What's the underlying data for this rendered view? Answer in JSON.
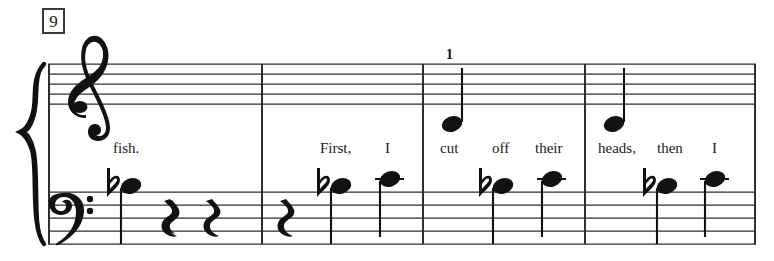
{
  "page": {
    "width": 774,
    "height": 261,
    "background": "#ffffff",
    "ink_color": "#111111"
  },
  "score": {
    "measure_number": "9",
    "system": {
      "left": 48,
      "right": 756,
      "brace": "curly-brace",
      "staves": [
        {
          "name": "treble",
          "clef": "treble-clef",
          "clef_glyph": "𝄞",
          "top_line_y": 64,
          "line_spacing": 10
        },
        {
          "name": "bass",
          "clef": "bass-clef",
          "clef_glyph": "𝄢",
          "top_line_y": 192,
          "line_spacing": 13
        }
      ],
      "barlines_x": [
        262,
        423,
        585,
        756
      ]
    },
    "measures": [
      {
        "index": 1,
        "number": "9",
        "x_start": 48,
        "x_end": 262,
        "treble_notes": [],
        "bass_notes": [
          {
            "x": 122,
            "y": 186,
            "accidental": "flat",
            "stem": "down",
            "head": "quarter-notehead",
            "ledger": false
          }
        ],
        "rests": [
          {
            "x": 173,
            "y": 218,
            "type": "quarter-rest"
          },
          {
            "x": 215,
            "y": 218,
            "type": "quarter-rest"
          }
        ]
      },
      {
        "index": 2,
        "number": "10",
        "x_start": 262,
        "x_end": 423,
        "treble_notes": [],
        "bass_notes": [
          {
            "x": 332,
            "y": 186,
            "accidental": "flat",
            "stem": "down",
            "head": "quarter-notehead",
            "ledger": false
          },
          {
            "x": 387,
            "y": 179,
            "accidental": "none",
            "stem": "down",
            "head": "quarter-notehead",
            "ledger": true
          }
        ],
        "rests": [
          {
            "x": 288,
            "y": 218,
            "type": "quarter-rest"
          }
        ]
      },
      {
        "index": 3,
        "number": "11",
        "x_start": 423,
        "x_end": 585,
        "fingering": {
          "text": "1",
          "x": 448,
          "y": 50
        },
        "treble_notes": [
          {
            "x": 452,
            "y": 124,
            "accidental": "none",
            "stem": "up",
            "head": "quarter-notehead",
            "ledger": false
          }
        ],
        "bass_notes": [
          {
            "x": 494,
            "y": 186,
            "accidental": "flat",
            "stem": "down",
            "head": "quarter-notehead",
            "ledger": false
          },
          {
            "x": 549,
            "y": 179,
            "accidental": "none",
            "stem": "down",
            "head": "quarter-notehead",
            "ledger": true
          }
        ],
        "rests": []
      },
      {
        "index": 4,
        "number": "12",
        "x_start": 585,
        "x_end": 756,
        "treble_notes": [
          {
            "x": 614,
            "y": 124,
            "accidental": "none",
            "stem": "up",
            "head": "quarter-notehead",
            "ledger": false
          }
        ],
        "bass_notes": [
          {
            "x": 658,
            "y": 186,
            "accidental": "flat",
            "stem": "down",
            "head": "quarter-notehead",
            "ledger": false
          },
          {
            "x": 714,
            "y": 179,
            "accidental": "none",
            "stem": "down",
            "head": "quarter-notehead",
            "ledger": true
          }
        ],
        "rests": []
      }
    ],
    "lyrics": [
      {
        "text": "fish.",
        "x": 113,
        "y": 141
      },
      {
        "text": "First,",
        "x": 320,
        "y": 141
      },
      {
        "text": "I",
        "x": 385,
        "y": 141
      },
      {
        "text": "cut",
        "x": 440,
        "y": 141
      },
      {
        "text": "off",
        "x": 492,
        "y": 141
      },
      {
        "text": "their",
        "x": 535,
        "y": 141
      },
      {
        "text": "heads,",
        "x": 598,
        "y": 141
      },
      {
        "text": "then",
        "x": 657,
        "y": 141
      },
      {
        "text": "I",
        "x": 712,
        "y": 141
      }
    ]
  }
}
